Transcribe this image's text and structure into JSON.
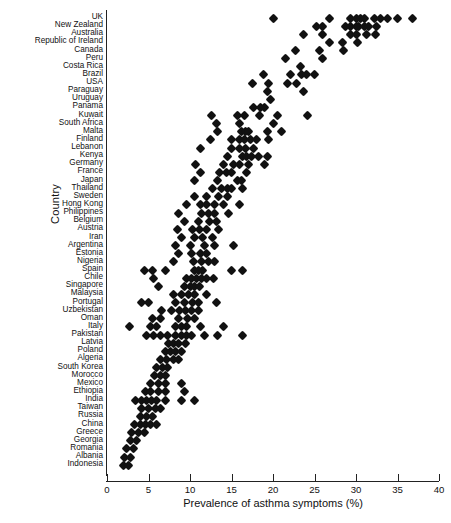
{
  "chart_data": {
    "type": "scatter",
    "title": "",
    "xlabel": "Prevalence of asthma symptoms (%)",
    "ylabel": "Country",
    "xlim": [
      0,
      40
    ],
    "xticks": [
      0,
      5,
      10,
      15,
      20,
      25,
      30,
      35,
      40
    ],
    "grid": false,
    "legend": "none",
    "marker": "filled-diamond",
    "marker_color": "#111111",
    "categories": [
      "UK",
      "New Zealand",
      "Australia",
      "Republic of Ireland",
      "Canada",
      "Peru",
      "Costa Rica",
      "Brazil",
      "USA",
      "Paraguay",
      "Uruguay",
      "Panama",
      "Kuwait",
      "South Africa",
      "Malta",
      "Finland",
      "Lebanon",
      "Kenya",
      "Germany",
      "France",
      "Japan",
      "Thailand",
      "Sweden",
      "Hong Kong",
      "Philippines",
      "Belgium",
      "Austria",
      "Iran",
      "Argentina",
      "Estonia",
      "Nigeria",
      "Spain",
      "Chile",
      "Singapore",
      "Malaysia",
      "Portugal",
      "Uzbekistan",
      "Oman",
      "Italy",
      "Pakistan",
      "Latvia",
      "Poland",
      "Algeria",
      "South Korea",
      "Morocco",
      "Mexico",
      "Ethiopia",
      "India",
      "Taiwan",
      "Russia",
      "China",
      "Greece",
      "Georgia",
      "Romania",
      "Albania",
      "Indonesia"
    ],
    "points": [
      {
        "country": "UK",
        "values": [
          20.0,
          26.8,
          29.3,
          30.0,
          30.5,
          31.0,
          32.2,
          33.0,
          33.8,
          35.0,
          36.8
        ]
      },
      {
        "country": "New Zealand",
        "values": [
          25.2,
          26.0,
          28.7,
          29.3,
          30.0,
          30.3,
          31.0,
          31.5,
          32.5
        ]
      },
      {
        "country": "Australia",
        "values": [
          23.7,
          26.0,
          29.3,
          30.0,
          31.3,
          32.3
        ]
      },
      {
        "country": "Republic of Ireland",
        "values": [
          26.8,
          28.4,
          30.2
        ]
      },
      {
        "country": "Canada",
        "values": [
          22.7,
          25.6,
          28.5
        ]
      },
      {
        "country": "Peru",
        "values": [
          21.5,
          26.0
        ]
      },
      {
        "country": "Costa Rica",
        "values": [
          23.3
        ]
      },
      {
        "country": "Brazil",
        "values": [
          18.8,
          22.1,
          23.4,
          24.0,
          25.0
        ]
      },
      {
        "country": "USA",
        "values": [
          17.5,
          19.5,
          21.8,
          22.8
        ]
      },
      {
        "country": "Paraguay",
        "values": [
          19.3,
          23.7
        ]
      },
      {
        "country": "Uruguay",
        "values": [
          19.7
        ]
      },
      {
        "country": "Panama",
        "values": [
          17.7,
          18.5,
          19.0
        ]
      },
      {
        "country": "Kuwait",
        "values": [
          12.6,
          15.7,
          16.6,
          18.4,
          20.6,
          24.2
        ]
      },
      {
        "country": "South Africa",
        "values": [
          13.2,
          16.0,
          20.0
        ]
      },
      {
        "country": "Malta",
        "values": [
          13.3,
          16.2,
          16.7,
          17.0,
          19.3,
          21.0
        ]
      },
      {
        "country": "Finland",
        "values": [
          12.5,
          15.0,
          16.0,
          16.6,
          17.3,
          18.0,
          19.5
        ]
      },
      {
        "country": "Lebanon",
        "values": [
          11.3,
          15.0,
          16.0,
          16.7,
          17.6
        ]
      },
      {
        "country": "Kenya",
        "values": [
          14.5,
          16.3,
          16.8,
          17.4,
          18.2,
          19.3
        ]
      },
      {
        "country": "Germany",
        "values": [
          10.7,
          14.0,
          15.2,
          16.0,
          17.0,
          19.0
        ]
      },
      {
        "country": "France",
        "values": [
          11.3,
          13.6,
          14.4,
          15.0,
          16.8
        ]
      },
      {
        "country": "Japan",
        "values": [
          10.5,
          13.3,
          15.7,
          16.2
        ]
      },
      {
        "country": "Thailand",
        "values": [
          12.7,
          13.8,
          14.5,
          15.0,
          16.3
        ]
      },
      {
        "country": "Sweden",
        "values": [
          10.5,
          12.0,
          13.4,
          14.5
        ]
      },
      {
        "country": "Hong Kong",
        "values": [
          9.6,
          11.3,
          12.0,
          13.0,
          14.0,
          16.0
        ]
      },
      {
        "country": "Philippines",
        "values": [
          8.6,
          11.4,
          12.2,
          13.0,
          14.6
        ]
      },
      {
        "country": "Belgium",
        "values": [
          9.3,
          11.0,
          12.3,
          13.2
        ]
      },
      {
        "country": "Austria",
        "values": [
          8.5,
          10.3,
          11.2,
          12.0,
          13.4
        ]
      },
      {
        "country": "Iran",
        "values": [
          9.0,
          10.6,
          11.5,
          12.7
        ]
      },
      {
        "country": "Argentina",
        "values": [
          8.2,
          10.0,
          11.7,
          13.0,
          15.3
        ]
      },
      {
        "country": "Estonia",
        "values": [
          8.6,
          10.2,
          11.3,
          12.0
        ]
      },
      {
        "country": "Nigeria",
        "values": [
          8.0,
          10.4,
          11.4,
          12.2,
          13.0
        ]
      },
      {
        "country": "Spain",
        "values": [
          4.5,
          5.5,
          7.0,
          10.5,
          11.0,
          11.5,
          15.0,
          16.3
        ]
      },
      {
        "country": "Chile",
        "values": [
          5.6,
          9.6,
          10.2,
          10.8,
          11.4,
          12.0,
          12.8
        ]
      },
      {
        "country": "Singapore",
        "values": [
          6.2,
          9.3,
          10.0,
          10.6,
          11.2
        ]
      },
      {
        "country": "Malaysia",
        "values": [
          8.0,
          9.0,
          9.8,
          10.6,
          12.0
        ]
      },
      {
        "country": "Portugal",
        "values": [
          4.2,
          5.0,
          8.3,
          9.3,
          10.3,
          11.0,
          13.2
        ]
      },
      {
        "country": "Uzbekistan",
        "values": [
          6.6,
          7.8,
          8.7,
          9.5,
          10.2,
          11.0
        ]
      },
      {
        "country": "Oman",
        "values": [
          5.5,
          6.5,
          8.6,
          9.7,
          10.6
        ]
      },
      {
        "country": "Italy",
        "values": [
          2.7,
          5.3,
          6.0,
          8.3,
          9.0,
          9.6,
          11.3,
          14.0
        ]
      },
      {
        "country": "Pakistan",
        "values": [
          4.8,
          5.6,
          6.4,
          7.3,
          8.3,
          9.0,
          9.6,
          10.2,
          11.7,
          13.3,
          16.3
        ]
      },
      {
        "country": "Latvia",
        "values": [
          7.4,
          8.0,
          8.6,
          9.4
        ]
      },
      {
        "country": "Poland",
        "values": [
          7.0,
          7.6,
          8.3,
          9.0
        ]
      },
      {
        "country": "Algeria",
        "values": [
          6.5,
          7.2,
          8.0,
          8.6
        ]
      },
      {
        "country": "South Korea",
        "values": [
          6.0,
          6.7,
          7.3
        ]
      },
      {
        "country": "Morocco",
        "values": [
          5.7,
          6.4,
          7.0
        ]
      },
      {
        "country": "Mexico",
        "values": [
          5.3,
          6.2,
          7.0,
          9.0
        ]
      },
      {
        "country": "Ethiopia",
        "values": [
          4.6,
          5.2,
          6.2,
          7.0,
          9.3
        ]
      },
      {
        "country": "India",
        "values": [
          3.4,
          4.2,
          4.8,
          5.4,
          6.0,
          7.0,
          9.0,
          10.5
        ]
      },
      {
        "country": "Taiwan",
        "values": [
          4.2,
          5.0,
          5.8,
          6.4
        ]
      },
      {
        "country": "Russia",
        "values": [
          4.0,
          4.8,
          5.5
        ]
      },
      {
        "country": "China",
        "values": [
          3.3,
          4.0,
          4.6,
          5.2,
          6.0
        ]
      },
      {
        "country": "Greece",
        "values": [
          3.0,
          3.8,
          4.5
        ]
      },
      {
        "country": "Georgia",
        "values": [
          2.8,
          3.5
        ]
      },
      {
        "country": "Romania",
        "values": [
          2.4,
          3.2
        ]
      },
      {
        "country": "Albania",
        "values": [
          2.1,
          2.8
        ]
      },
      {
        "country": "Indonesia",
        "values": [
          2.0,
          2.6
        ]
      }
    ]
  }
}
